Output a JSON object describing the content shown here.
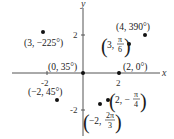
{
  "diagram": {
    "axes": {
      "x_label": "x",
      "y_label": "y",
      "x_ticks": [
        "-2",
        "2"
      ],
      "y_ticks": [
        "2",
        "-2"
      ]
    },
    "points": [
      {
        "id": "p1",
        "label": "(3, −225°)"
      },
      {
        "id": "p2",
        "label": "(4, 390°)"
      },
      {
        "id": "p3",
        "label_r": "3,",
        "label_num": "π",
        "label_den": "6"
      },
      {
        "id": "p4",
        "label": "(0, 35°)"
      },
      {
        "id": "p5",
        "label": "(2, 0°)"
      },
      {
        "id": "p6",
        "label": "(−2, 45°)"
      },
      {
        "id": "p7",
        "label_r": "2, −",
        "label_num": "π",
        "label_den": "4"
      },
      {
        "id": "p8",
        "label_r": "−2,",
        "label_num": "2π",
        "label_den": "3"
      }
    ],
    "colors": {
      "axis": "#555555",
      "point": "#111111",
      "text": "#1a1a1a"
    }
  }
}
